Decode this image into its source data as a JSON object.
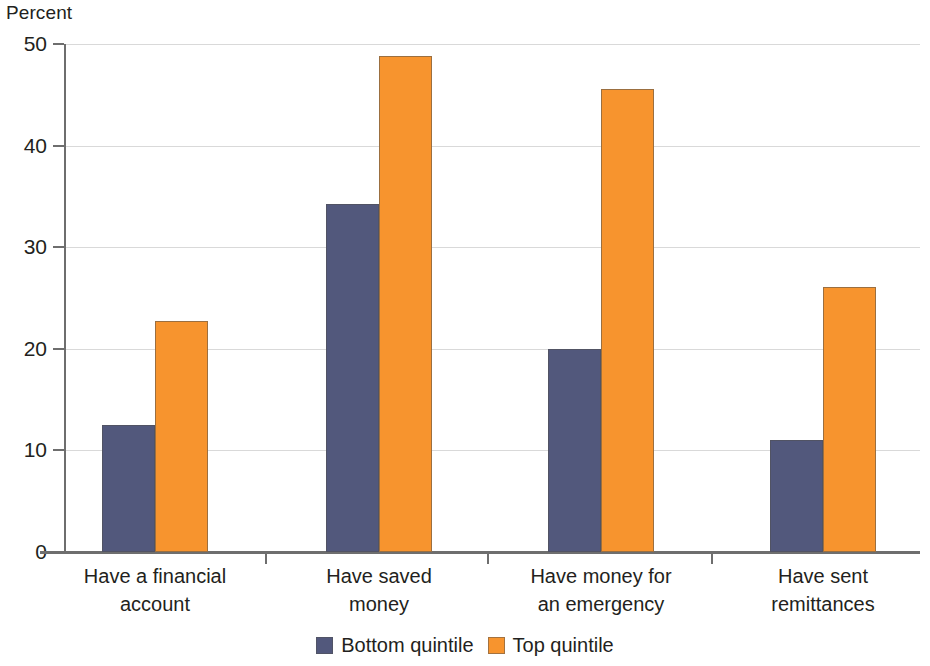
{
  "chart_data": {
    "type": "bar",
    "title": "",
    "subtitle": "",
    "xlabel": "",
    "ylabel": "Percent",
    "ylim": [
      0,
      50
    ],
    "yticks": [
      0,
      10,
      20,
      30,
      40,
      50
    ],
    "ytick_labels": [
      "0",
      "10",
      "20",
      "30",
      "40",
      "50"
    ],
    "grid": "horizontal",
    "legend_position": "bottom-center",
    "categories": [
      "Have a financial account",
      "Have saved money",
      "Have money for an emergency",
      "Have sent remittances"
    ],
    "category_lines": [
      [
        "Have a financial",
        "account"
      ],
      [
        "Have saved",
        "money"
      ],
      [
        "Have money for",
        "an emergency"
      ],
      [
        "Have sent",
        "remittances"
      ]
    ],
    "series": [
      {
        "name": "Bottom quintile",
        "color": "#52587c",
        "values": [
          12.5,
          34.3,
          20.0,
          11.0
        ]
      },
      {
        "name": "Top quintile",
        "color": "#f7942e",
        "values": [
          22.7,
          48.8,
          45.6,
          26.1
        ]
      }
    ]
  }
}
